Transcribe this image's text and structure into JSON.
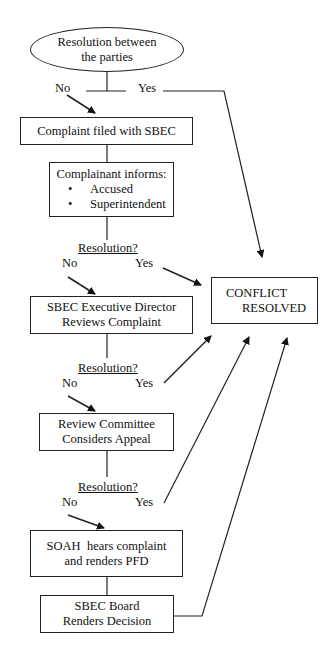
{
  "diagram": {
    "type": "flowchart",
    "start": {
      "line1": "Resolution between",
      "line2": "the parties"
    },
    "branch_no": "No",
    "branch_yes": "Yes",
    "steps": [
      {
        "id": "complaint-filed",
        "lines": [
          "Complaint filed with SBEC"
        ]
      },
      {
        "id": "complainant-informs",
        "title": "Complainant informs:",
        "bullets": [
          "Accused",
          "Superintendent"
        ]
      },
      {
        "id": "exec-director",
        "lines": [
          "SBEC Executive Director",
          "Reviews Complaint"
        ]
      },
      {
        "id": "review-committee",
        "lines": [
          "Review Committee",
          "Considers Appeal"
        ]
      },
      {
        "id": "soah",
        "lines": [
          "SOAH  hears complaint",
          "and renders PFD"
        ]
      },
      {
        "id": "board-decision",
        "lines": [
          "SBEC Board",
          "Renders Decision"
        ]
      }
    ],
    "decisions": [
      {
        "question": "Resolution?",
        "no": "No",
        "yes": "Yes"
      },
      {
        "question": "Resolution?",
        "no": "No",
        "yes": "Yes"
      },
      {
        "question": "Resolution?",
        "no": "No",
        "yes": "Yes"
      }
    ],
    "end": {
      "line1": "CONFLICT",
      "line2": "RESOLVED"
    }
  }
}
